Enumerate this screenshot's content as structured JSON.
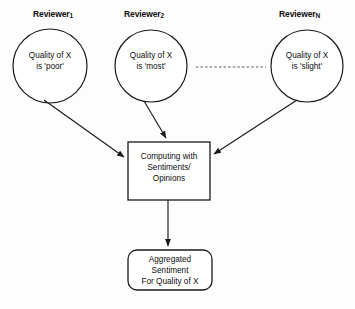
{
  "diagram": {
    "background_color": "#fdfdfd",
    "stroke_color": "#1a1a1a",
    "text_color": "#0d0d0d",
    "reviewers": [
      {
        "label_main": "Reviewer",
        "label_sub": "1",
        "statement": "Quality of X\nis 'poor'",
        "cx": 50,
        "cy": 66,
        "r": 37
      },
      {
        "label_main": "Reviewer",
        "label_sub": "2",
        "statement": "Quality of X\nis 'most'",
        "cx": 151,
        "cy": 66,
        "r": 36
      },
      {
        "label_main": "Reviewer",
        "label_sub": "N",
        "statement": "Quality of X\nis 'slight'",
        "cx": 307,
        "cy": 66,
        "r": 36
      }
    ],
    "ellipsis": {
      "name": "dotted-continuation",
      "x1": 196,
      "x2": 266,
      "y": 67
    },
    "process_box": {
      "text": "Computing with\nSentiments/\nOpinions",
      "x": 128,
      "y": 142,
      "width": 82,
      "height": 58
    },
    "output_box": {
      "text": "Aggregated\nSentiment\nFor Quality of X",
      "x": 128,
      "y": 250,
      "width": 84,
      "height": 40,
      "corner_radius": 9
    },
    "arrows": [
      {
        "name": "arrow-reviewer1-to-process",
        "x1": 44,
        "y1": 100,
        "x2": 126,
        "y2": 158
      },
      {
        "name": "arrow-reviewer2-to-process",
        "x1": 146,
        "y1": 102,
        "x2": 167,
        "y2": 140
      },
      {
        "name": "arrow-reviewer3-to-process",
        "x1": 296,
        "y1": 100,
        "x2": 213,
        "y2": 155
      },
      {
        "name": "arrow-process-to-output",
        "x1": 168,
        "y1": 200,
        "x2": 168,
        "y2": 248
      }
    ]
  }
}
